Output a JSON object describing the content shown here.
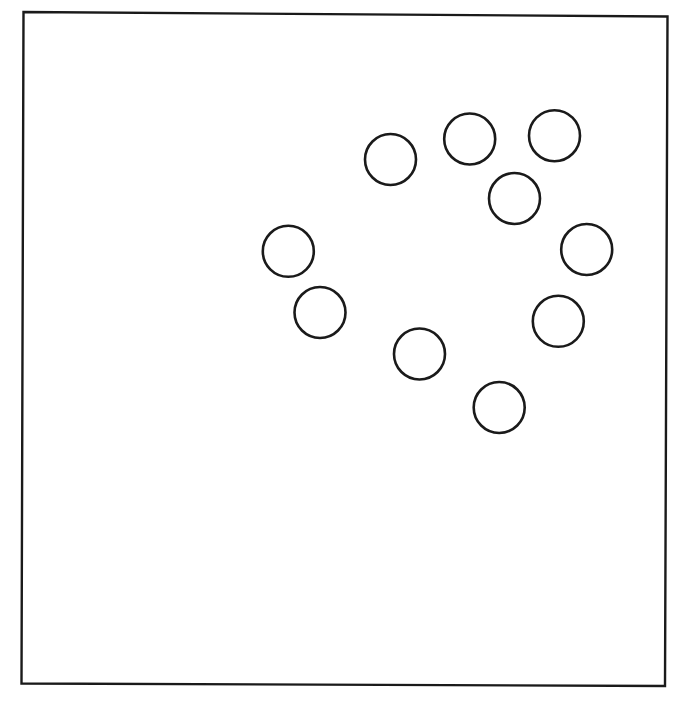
{
  "canvas": {
    "width": 692,
    "height": 705,
    "background": "#ffffff"
  },
  "frame": {
    "points": [
      [
        23.5,
        12
      ],
      [
        667.5,
        16.5
      ],
      [
        665,
        686
      ],
      [
        21.5,
        683.5
      ]
    ],
    "stroke": "#1a1a1a",
    "stroke_width": 2.4
  },
  "circles": {
    "stroke": "#1a1a1a",
    "stroke_width": 2.6,
    "fill": "none",
    "radius": 25.5,
    "items": [
      {
        "cx": 390.5,
        "cy": 159.5
      },
      {
        "cx": 469.7,
        "cy": 139
      },
      {
        "cx": 554.5,
        "cy": 135.7
      },
      {
        "cx": 514.5,
        "cy": 198.5
      },
      {
        "cx": 288.3,
        "cy": 251.3
      },
      {
        "cx": 586.7,
        "cy": 249.5
      },
      {
        "cx": 320,
        "cy": 312.5
      },
      {
        "cx": 558.3,
        "cy": 321.3
      },
      {
        "cx": 419.5,
        "cy": 354
      },
      {
        "cx": 499.2,
        "cy": 407.5
      }
    ]
  }
}
